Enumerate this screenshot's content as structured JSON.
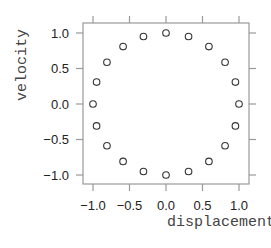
{
  "chart_data": {
    "type": "scatter",
    "title": "",
    "xlabel": "displacement",
    "ylabel": "velocity",
    "xlim": [
      -1.1,
      1.1
    ],
    "ylim": [
      -1.1,
      1.1
    ],
    "xticks": [
      -1.0,
      -0.5,
      0.0,
      0.5,
      1.0
    ],
    "yticks": [
      -1.0,
      -0.5,
      0.0,
      0.5,
      1.0
    ],
    "xtick_labels": [
      "−1.0",
      "−0.5",
      "0.0",
      "0.5",
      "1.0"
    ],
    "ytick_labels": [
      "−1.0",
      "−0.5",
      "0.0",
      "0.5",
      "1.0"
    ],
    "grid": false,
    "legend": null,
    "marker": "open-circle",
    "series": [
      {
        "name": "phase",
        "x": [
          1.0,
          0.951,
          0.809,
          0.588,
          0.309,
          0.0,
          -0.309,
          -0.588,
          -0.809,
          -0.951,
          -1.0,
          -0.951,
          -0.809,
          -0.588,
          -0.309,
          0.0,
          0.309,
          0.588,
          0.809,
          0.951
        ],
        "y": [
          0.0,
          0.309,
          0.588,
          0.809,
          0.951,
          1.0,
          0.951,
          0.809,
          0.588,
          0.309,
          0.0,
          -0.309,
          -0.588,
          -0.809,
          -0.951,
          -1.0,
          -0.951,
          -0.809,
          -0.588,
          -0.309
        ]
      }
    ]
  },
  "colors": {
    "frame": "#999999",
    "points": "#333333",
    "tick_text": "#222222",
    "axis_title": "#444444"
  }
}
